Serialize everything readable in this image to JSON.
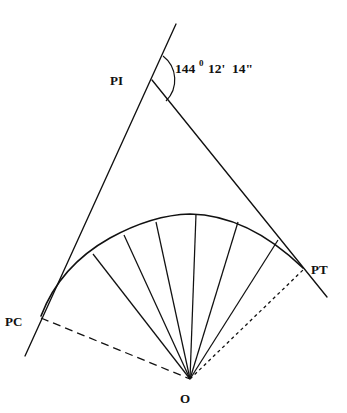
{
  "figure": {
    "type": "horizontal-curve-diagram",
    "background_color": "#ffffff",
    "line_color": "#111111"
  },
  "labels": {
    "pi": "PI",
    "pc": "PC",
    "pt": "PT",
    "center": "O"
  },
  "angle": {
    "degrees": "144",
    "degree_mark": "0",
    "minutes": "12'",
    "seconds": "14\"",
    "full_text": "144⁰ 12' 14\""
  },
  "geometry": {
    "pi_vertex": {
      "x": 152,
      "y": 80
    },
    "pc_point": {
      "x": 41,
      "y": 316
    },
    "pt_point": {
      "x": 303,
      "y": 268
    },
    "center_point": {
      "x": 190,
      "y": 379
    },
    "arc_apex": {
      "x": 186,
      "y": 214
    },
    "back_tangent": {
      "x1": 176,
      "y1": 24,
      "x2": 25,
      "y2": 356
    },
    "forward_tangent": {
      "x1": 152,
      "y1": 80,
      "x2": 327,
      "y2": 297
    },
    "radial_count": 6,
    "radial_endpoints_on_arc": [
      {
        "x": 93,
        "y": 254
      },
      {
        "x": 124,
        "y": 235
      },
      {
        "x": 156,
        "y": 222
      },
      {
        "x": 196,
        "y": 214
      },
      {
        "x": 238,
        "y": 222
      },
      {
        "x": 278,
        "y": 240
      }
    ],
    "chord_pc_to_o_style": "dashed",
    "chord_o_to_pt_style": "dotted"
  },
  "elements": {
    "back_tangent_name": "back-tangent-line",
    "forward_tangent_name": "forward-tangent-line",
    "curve_name": "circular-curve-arc",
    "angle_arc_name": "intersection-angle-arc"
  }
}
